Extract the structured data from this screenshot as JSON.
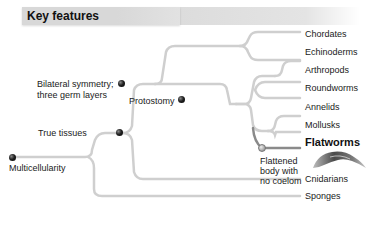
{
  "header": {
    "title": "Key features"
  },
  "colors": {
    "branch": "#cfcfcf",
    "highlight_branch": "#8a8a8a",
    "node": "#111111",
    "header_band": "#d8d8d8"
  },
  "nodes": {
    "multicellularity": "Multicellularity",
    "true_tissues": "True tissues",
    "bilateral": [
      "Bilateral symmetry;",
      "three germ layers"
    ],
    "protostomy": "Protostomy",
    "flattened": [
      "Flattened",
      "body with",
      "no coelom"
    ]
  },
  "taxa": {
    "chordates": "Chordates",
    "echinoderms": "Echinoderms",
    "arthropods": "Arthropods",
    "roundworms": "Roundworms",
    "annelids": "Annelids",
    "mollusks": "Mollusks",
    "flatworms": "Flatworms",
    "cnidarians": "Cnidarians",
    "sponges": "Sponges"
  },
  "image": {
    "icon": "flatworm-illustration"
  }
}
